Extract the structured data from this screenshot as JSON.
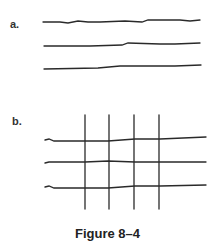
{
  "figure": {
    "caption": "Figure 8–4",
    "panels": [
      {
        "label": "a.",
        "description": "Three parallel wavy horizontal lines"
      },
      {
        "label": "b.",
        "description": "Three wavy horizontal lines crossed by four vertical lines forming a grid"
      }
    ]
  },
  "colors": {
    "stroke": "#2a2a2a",
    "background": "#ffffff"
  }
}
